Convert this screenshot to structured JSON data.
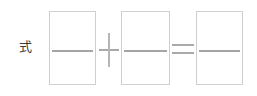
{
  "worksheet": {
    "label": "式",
    "label_semantic": "shiki-expression-label",
    "expression": {
      "operands": [
        {
          "name": "first-addend",
          "value": ""
        },
        {
          "name": "second-addend",
          "value": ""
        }
      ],
      "result": {
        "name": "sum",
        "value": ""
      },
      "operators": [
        {
          "name": "plus",
          "symbol": "+"
        },
        {
          "name": "equals",
          "symbol": "="
        }
      ]
    },
    "boxes": [
      {
        "id": "answer-box-1",
        "value": "",
        "placeholder": ""
      },
      {
        "id": "answer-box-2",
        "value": "",
        "placeholder": ""
      },
      {
        "id": "answer-box-3",
        "value": "",
        "placeholder": ""
      }
    ]
  },
  "colors": {
    "background": "#ffffff",
    "box_border": "#cfcfcf",
    "rule_line": "#a5a5a5",
    "operator": "#a9a9a9",
    "label_text": "#3c3c3c"
  }
}
